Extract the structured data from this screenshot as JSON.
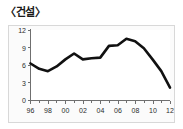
{
  "title": "〈건설〉",
  "chart_data": {
    "type": "line",
    "title": "〈건설〉",
    "xlabel": "",
    "ylabel": "",
    "x": [
      1996,
      1997,
      1998,
      1999,
      2000,
      2001,
      2002,
      2003,
      2004,
      2005,
      2006,
      2007,
      2008,
      2009,
      2010,
      2011,
      2012
    ],
    "xtick_labels": [
      "96",
      "98",
      "00",
      "02",
      "04",
      "06",
      "08",
      "10",
      "12"
    ],
    "xtick_values": [
      1996,
      1998,
      2000,
      2002,
      2004,
      2006,
      2008,
      2010,
      2012
    ],
    "ytick_labels": [
      "0",
      "3",
      "6",
      "9",
      "12"
    ],
    "ytick_values": [
      0,
      3,
      6,
      9,
      12
    ],
    "ylim": [
      0,
      12
    ],
    "xlim": [
      1996,
      2012
    ],
    "grid": false,
    "legend": null,
    "line_color": "#111111",
    "series": [
      {
        "name": "건설",
        "values": [
          6.3,
          5.4,
          5.0,
          5.8,
          7.0,
          8.0,
          7.0,
          7.2,
          7.3,
          9.3,
          9.4,
          10.5,
          10.1,
          8.9,
          7.0,
          5.0,
          2.2
        ]
      }
    ]
  },
  "colors": {
    "line": "#111111",
    "axis": "#6f6f6f",
    "frame": "#d8d8d8",
    "text": "#2b2b2b",
    "background": "#ffffff"
  }
}
